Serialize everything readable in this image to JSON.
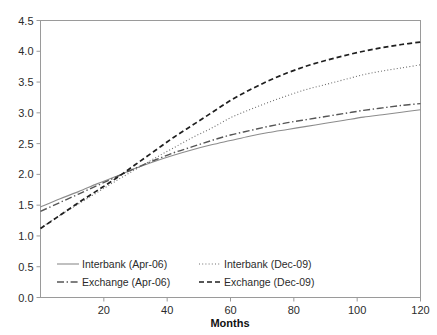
{
  "chart_data": {
    "type": "line",
    "title": "",
    "xlabel": "Months",
    "ylabel": "",
    "xlim": [
      0,
      120
    ],
    "ylim": [
      0.0,
      4.5
    ],
    "grid": false,
    "legend_position": "inside-bottom-left",
    "xticks": [
      "20",
      "40",
      "60",
      "80",
      "100",
      "120"
    ],
    "xtick_values": [
      20,
      40,
      60,
      80,
      100,
      120
    ],
    "yticks": [
      "0.0",
      "0.5",
      "1.0",
      "1.5",
      "2.0",
      "2.5",
      "3.0",
      "3.5",
      "4.0",
      "4.5"
    ],
    "ytick_values": [
      0.0,
      0.5,
      1.0,
      1.5,
      2.0,
      2.5,
      3.0,
      3.5,
      4.0,
      4.5
    ],
    "x": [
      0,
      6,
      12,
      18,
      24,
      30,
      36,
      42,
      48,
      54,
      60,
      66,
      72,
      78,
      84,
      90,
      96,
      102,
      108,
      114,
      120
    ],
    "series": [
      {
        "name": "Interbank (Apr-06)",
        "style": "solid",
        "color": "#8c8c8c",
        "values": [
          1.47,
          1.6,
          1.72,
          1.85,
          1.97,
          2.1,
          2.21,
          2.31,
          2.4,
          2.48,
          2.55,
          2.62,
          2.68,
          2.73,
          2.78,
          2.83,
          2.88,
          2.93,
          2.97,
          3.01,
          3.05
        ]
      },
      {
        "name": "Exchange (Apr-06)",
        "style": "dashdot",
        "color": "#555555",
        "values": [
          1.4,
          1.54,
          1.68,
          1.82,
          1.96,
          2.1,
          2.23,
          2.35,
          2.45,
          2.55,
          2.64,
          2.71,
          2.78,
          2.84,
          2.89,
          2.94,
          2.99,
          3.04,
          3.08,
          3.12,
          3.15
        ]
      },
      {
        "name": "Interbank (Dec-09)",
        "style": "dotted",
        "color": "#6e6e6e",
        "values": [
          1.13,
          1.33,
          1.52,
          1.71,
          1.9,
          2.08,
          2.26,
          2.43,
          2.6,
          2.75,
          2.92,
          3.05,
          3.17,
          3.28,
          3.38,
          3.46,
          3.54,
          3.62,
          3.68,
          3.73,
          3.78
        ]
      },
      {
        "name": "Exchange (Dec-09)",
        "style": "dashed",
        "color": "#1f1f1f",
        "values": [
          1.12,
          1.33,
          1.54,
          1.74,
          1.94,
          2.16,
          2.38,
          2.6,
          2.8,
          3.0,
          3.2,
          3.37,
          3.52,
          3.65,
          3.76,
          3.85,
          3.93,
          4.0,
          4.06,
          4.11,
          4.15
        ]
      }
    ]
  },
  "legend": {
    "entries": [
      {
        "label": "Interbank (Apr-06)"
      },
      {
        "label": "Interbank (Dec-09)"
      },
      {
        "label": "Exchange (Apr-06)"
      },
      {
        "label": "Exchange (Dec-09)"
      }
    ]
  },
  "axis": {
    "x_title": "Months"
  }
}
